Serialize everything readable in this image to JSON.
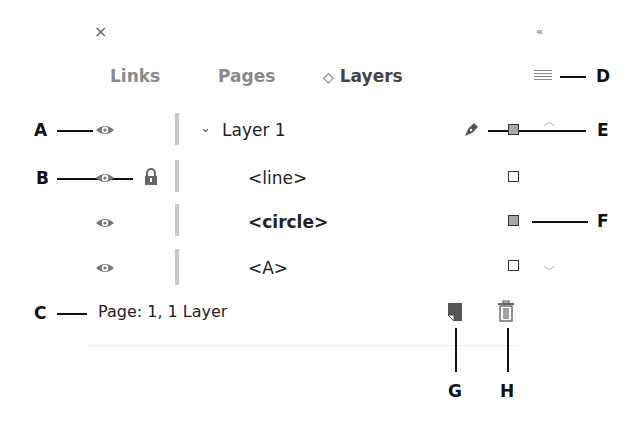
{
  "panel": {
    "close_icon": "×",
    "collapse_icon": "‹‹",
    "tabs": [
      {
        "label": "Links",
        "active": false
      },
      {
        "label": "Pages",
        "active": false
      },
      {
        "label": "Layers",
        "active": true,
        "prefix_icon": "◇"
      }
    ],
    "menu_icon": "panel-menu-icon"
  },
  "layers": [
    {
      "name": "Layer 1",
      "indent": 0,
      "bold": false,
      "expanded": true,
      "visible": true,
      "locked": false,
      "pen": true,
      "selected_square": true
    },
    {
      "name": "<line>",
      "indent": 1,
      "bold": false,
      "visible": true,
      "locked": true,
      "pen": false,
      "selected_square": false
    },
    {
      "name": "<circle>",
      "indent": 1,
      "bold": true,
      "visible": true,
      "locked": false,
      "pen": false,
      "selected_square": true
    },
    {
      "name": "<A>",
      "indent": 1,
      "bold": false,
      "visible": true,
      "locked": false,
      "pen": false,
      "selected_square": false
    }
  ],
  "status": {
    "text": "Page: 1, 1 Layer"
  },
  "callouts": {
    "A": "A",
    "B": "B",
    "C": "C",
    "D": "D",
    "E": "E",
    "F": "F",
    "G": "G",
    "H": "H"
  },
  "colors": {
    "selected_square": "#a8a8a8",
    "divider": "#c8c8c8",
    "tab_inactive": "#8a8a8a"
  }
}
